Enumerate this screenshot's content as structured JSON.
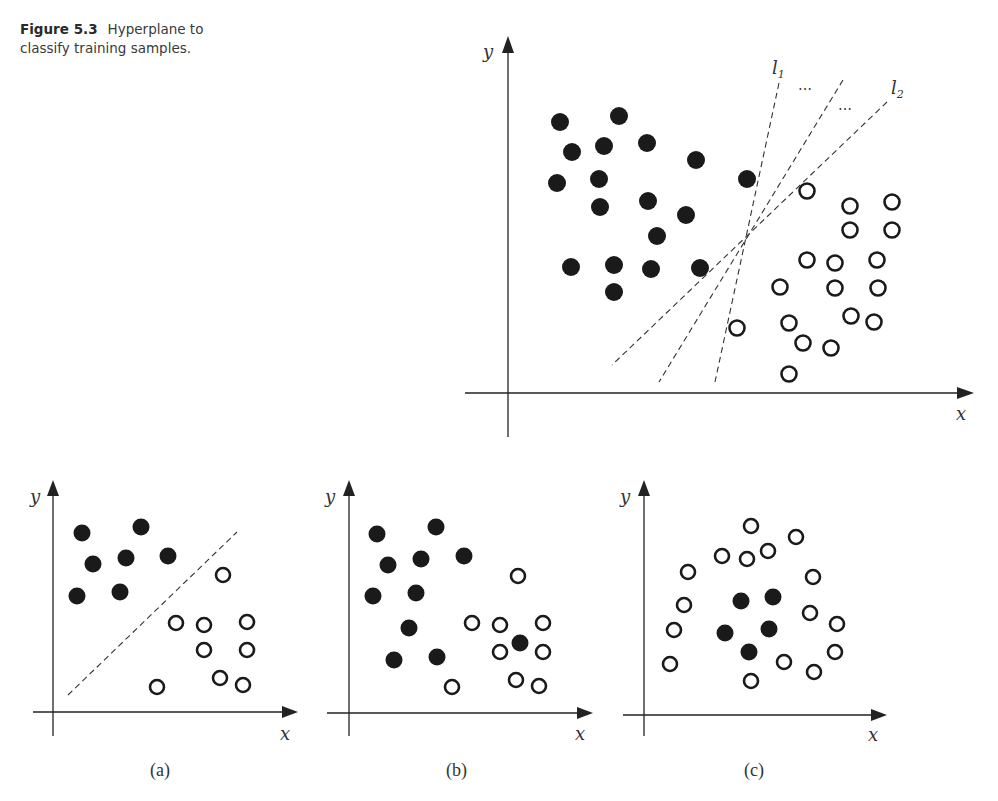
{
  "caption": {
    "number": "Figure 5.3",
    "text": "Hyperplane to classify training samples."
  },
  "labels": {
    "x": "x",
    "y": "y",
    "l1": "l",
    "l1_sub": "1",
    "l2": "l",
    "l2_sub": "2",
    "ellipsis": "⋯",
    "panel_a": "(a)",
    "panel_b": "(b)",
    "panel_c": "(c)"
  },
  "chart_data": [
    {
      "type": "scatter",
      "title": "Main: multiple separating hyperplanes",
      "xlabel": "x",
      "ylabel": "y",
      "axes": {
        "origin": [
          508,
          393
        ],
        "x_end": 973,
        "y_end": 40
      },
      "filled": [
        [
          560,
          122
        ],
        [
          619,
          116
        ],
        [
          572,
          152
        ],
        [
          604,
          146
        ],
        [
          647,
          143
        ],
        [
          696,
          160
        ],
        [
          557,
          183
        ],
        [
          599,
          179
        ],
        [
          747,
          179
        ],
        [
          600,
          207
        ],
        [
          648,
          201
        ],
        [
          686,
          215
        ],
        [
          657,
          236
        ],
        [
          571,
          267
        ],
        [
          614,
          265
        ],
        [
          651,
          269
        ],
        [
          700,
          268
        ],
        [
          614,
          292
        ]
      ],
      "open": [
        [
          807,
          191
        ],
        [
          850,
          206
        ],
        [
          892,
          202
        ],
        [
          850,
          230
        ],
        [
          892,
          230
        ],
        [
          807,
          260
        ],
        [
          835,
          263
        ],
        [
          877,
          260
        ],
        [
          780,
          287
        ],
        [
          835,
          288
        ],
        [
          878,
          288
        ],
        [
          851,
          316
        ],
        [
          874,
          322
        ],
        [
          737,
          328
        ],
        [
          789,
          323
        ],
        [
          803,
          343
        ],
        [
          831,
          348
        ],
        [
          789,
          374
        ]
      ],
      "lines": [
        {
          "name": "l1",
          "from": [
            779,
            83
          ],
          "to": [
            715,
            382
          ]
        },
        {
          "name": "middle",
          "from": [
            843,
            80
          ],
          "to": [
            659,
            382
          ]
        },
        {
          "name": "l2",
          "from": [
            887,
            102
          ],
          "to": [
            612,
            365
          ]
        }
      ]
    },
    {
      "type": "scatter",
      "title": "(a) linearly separable",
      "xlabel": "x",
      "ylabel": "y",
      "axes": {
        "origin": [
          53,
          712
        ],
        "x_end": 298,
        "y_end": 483
      },
      "filled": [
        [
          82,
          533
        ],
        [
          141,
          527
        ],
        [
          93,
          564
        ],
        [
          126,
          558
        ],
        [
          168,
          556
        ],
        [
          77,
          596
        ],
        [
          120,
          592
        ]
      ],
      "open": [
        [
          223,
          575
        ],
        [
          176,
          623
        ],
        [
          204,
          625
        ],
        [
          247,
          622
        ],
        [
          204,
          650
        ],
        [
          247,
          650
        ],
        [
          220,
          678
        ],
        [
          243,
          685
        ],
        [
          157,
          687
        ]
      ],
      "lines": [
        {
          "name": "separator",
          "from": [
            68,
            695
          ],
          "to": [
            237,
            532
          ]
        }
      ]
    },
    {
      "type": "scatter",
      "title": "(b) approximately linearly separable",
      "xlabel": "x",
      "ylabel": "y",
      "axes": {
        "origin": [
          349,
          713
        ],
        "x_end": 593,
        "y_end": 483
      },
      "filled": [
        [
          377,
          534
        ],
        [
          436,
          527
        ],
        [
          388,
          565
        ],
        [
          421,
          559
        ],
        [
          464,
          556
        ],
        [
          373,
          596
        ],
        [
          416,
          593
        ],
        [
          409,
          628
        ],
        [
          394,
          660
        ],
        [
          437,
          657
        ],
        [
          520,
          643
        ]
      ],
      "open": [
        [
          518,
          576
        ],
        [
          472,
          623
        ],
        [
          500,
          625
        ],
        [
          543,
          623
        ],
        [
          500,
          652
        ],
        [
          543,
          652
        ],
        [
          516,
          680
        ],
        [
          539,
          686
        ],
        [
          452,
          687
        ]
      ],
      "lines": []
    },
    {
      "type": "scatter",
      "title": "(c) not linearly separable",
      "xlabel": "x",
      "ylabel": "y",
      "axes": {
        "origin": [
          644,
          715
        ],
        "x_end": 887,
        "y_end": 483
      },
      "filled": [
        [
          741,
          601
        ],
        [
          773,
          597
        ],
        [
          725,
          633
        ],
        [
          769,
          629
        ],
        [
          749,
          652
        ]
      ],
      "open": [
        [
          751,
          526
        ],
        [
          796,
          537
        ],
        [
          722,
          556
        ],
        [
          747,
          559
        ],
        [
          768,
          551
        ],
        [
          688,
          572
        ],
        [
          813,
          577
        ],
        [
          684,
          605
        ],
        [
          810,
          613
        ],
        [
          837,
          624
        ],
        [
          674,
          630
        ],
        [
          835,
          652
        ],
        [
          670,
          664
        ],
        [
          784,
          662
        ],
        [
          814,
          672
        ],
        [
          751,
          681
        ]
      ],
      "lines": []
    }
  ]
}
